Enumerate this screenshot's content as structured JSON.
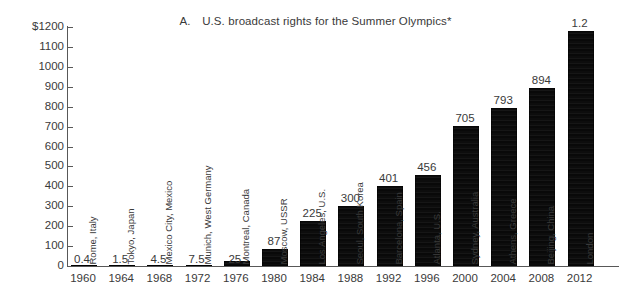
{
  "chart_data": {
    "type": "bar",
    "title": "A.  U.S. broadcast rights for the Summer Olympics*",
    "title_prefix": "A.",
    "title_text": "U.S. broadcast rights for the Summer Olympics*",
    "xlabel": "",
    "ylabel": "",
    "ylim": [
      0,
      1200
    ],
    "ytick_step": 100,
    "grid": false,
    "legend": "none",
    "units_note": "millions of U.S. dollars; 2012 value shown as 1.2 (billion)",
    "ytick_labels": [
      "$1200",
      "1100",
      "1000",
      "900",
      "800",
      "700",
      "600",
      "500",
      "400",
      "300",
      "200",
      "100",
      "0"
    ],
    "ytick_values": [
      1200,
      1100,
      1000,
      900,
      800,
      700,
      600,
      500,
      400,
      300,
      200,
      100,
      0
    ],
    "categories": [
      "1960",
      "1964",
      "1968",
      "1972",
      "1976",
      "1980",
      "1984",
      "1988",
      "1992",
      "1996",
      "2000",
      "2004",
      "2008",
      "2012"
    ],
    "values": [
      0.4,
      1.5,
      4.5,
      7.5,
      25,
      87,
      225,
      300,
      401,
      456,
      705,
      793,
      894,
      1180
    ],
    "data_labels": [
      "0.4",
      "1.5",
      "4.5",
      "7.5",
      "25",
      "87",
      "225",
      "300",
      "401",
      "456",
      "705",
      "793",
      "894",
      "1.2"
    ],
    "point_labels": [
      "Rome, Italy",
      "Tokyo, Japan",
      "Mexico City, Mexico",
      "Munich, West Germany",
      "Montreal, Canada",
      "Moscow, USSR",
      "Los Angeles, U.S.",
      "Seoul, South Korea",
      "Barcelona, Spain",
      "Atlanta, U.S.",
      "Sydney, Australia",
      "Athens, Greece",
      "Beijing, China",
      "London"
    ],
    "bar_color": "#111111",
    "axis_color": "#585858",
    "text_color": "#3a3a3a",
    "background_color": "#ffffff",
    "series": [
      {
        "name": "U.S. broadcast rights",
        "points": [
          {
            "year": "1960",
            "city": "Rome, Italy",
            "value": 0.4,
            "label": "0.4"
          },
          {
            "year": "1964",
            "city": "Tokyo, Japan",
            "value": 1.5,
            "label": "1.5"
          },
          {
            "year": "1968",
            "city": "Mexico City, Mexico",
            "value": 4.5,
            "label": "4.5"
          },
          {
            "year": "1972",
            "city": "Munich, West Germany",
            "value": 7.5,
            "label": "7.5"
          },
          {
            "year": "1976",
            "city": "Montreal, Canada",
            "value": 25,
            "label": "25"
          },
          {
            "year": "1980",
            "city": "Moscow, USSR",
            "value": 87,
            "label": "87"
          },
          {
            "year": "1984",
            "city": "Los Angeles, U.S.",
            "value": 225,
            "label": "225"
          },
          {
            "year": "1988",
            "city": "Seoul, South Korea",
            "value": 300,
            "label": "300"
          },
          {
            "year": "1992",
            "city": "Barcelona, Spain",
            "value": 401,
            "label": "401"
          },
          {
            "year": "1996",
            "city": "Atlanta, U.S.",
            "value": 456,
            "label": "456"
          },
          {
            "year": "2000",
            "city": "Sydney, Australia",
            "value": 705,
            "label": "705"
          },
          {
            "year": "2004",
            "city": "Athens, Greece",
            "value": 793,
            "label": "793"
          },
          {
            "year": "2008",
            "city": "Beijing, China",
            "value": 894,
            "label": "894"
          },
          {
            "year": "2012",
            "city": "London",
            "value": 1180,
            "label": "1.2"
          }
        ]
      }
    ]
  }
}
